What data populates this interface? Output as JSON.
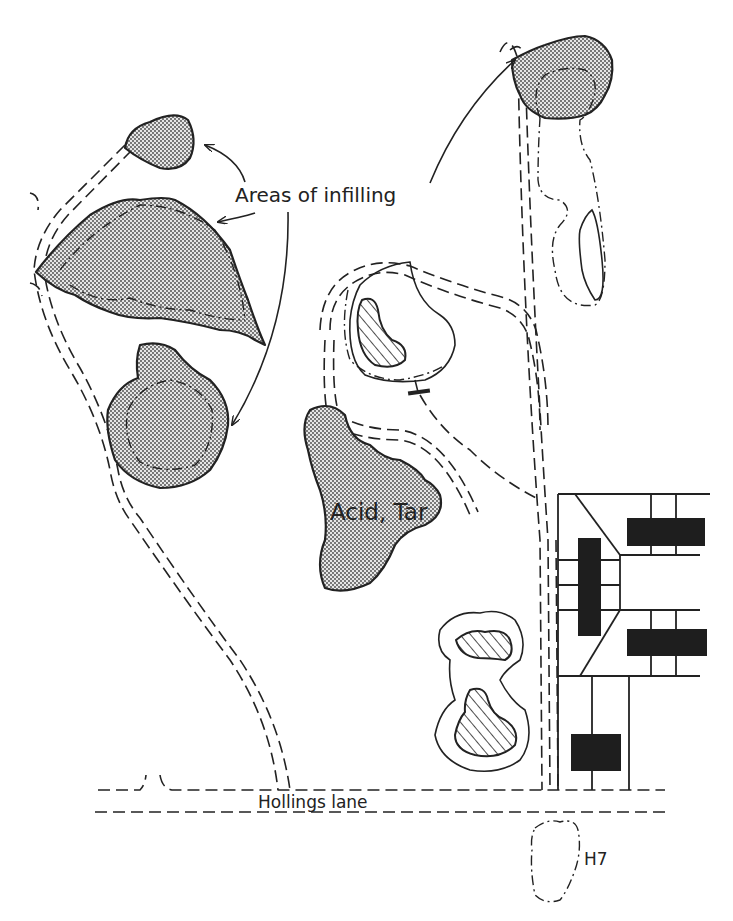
{
  "map": {
    "labels": {
      "areas_of_infilling": "Areas of infilling",
      "acid_tar": "Acid, Tar",
      "hollings_lane": "Hollings lane",
      "h7": "H7"
    },
    "colors": {
      "ink": "#222222",
      "background": "#ffffff",
      "stipple_fill": "#bdbdbd",
      "building_fill": "#1e1e1e"
    },
    "features": [
      {
        "type": "infilled-area",
        "name": "top-left small infill"
      },
      {
        "type": "infilled-area",
        "name": "large triangular infill"
      },
      {
        "type": "infilled-area",
        "name": "lower-left infill"
      },
      {
        "type": "infilled-area",
        "name": "top-right infill"
      },
      {
        "type": "tipped-area",
        "name": "Acid, Tar"
      },
      {
        "type": "hatched-pond",
        "name": "central lagoon"
      },
      {
        "type": "hatched-pond",
        "name": "lower lagoons"
      },
      {
        "type": "buildings",
        "name": "building block east"
      },
      {
        "type": "road",
        "name": "Hollings lane"
      },
      {
        "type": "site",
        "name": "H7"
      }
    ]
  }
}
